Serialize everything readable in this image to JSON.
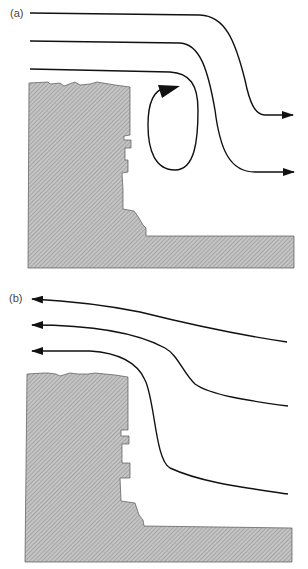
{
  "panels": [
    {
      "label": "(a)",
      "description": "Flow over block with recirculation eddy, left-to-right flow"
    },
    {
      "label": "(b)",
      "description": "Reversed flow, right-to-left over block"
    }
  ],
  "colors": {
    "block_fill": "#b8b8b8",
    "line": "#111111"
  }
}
